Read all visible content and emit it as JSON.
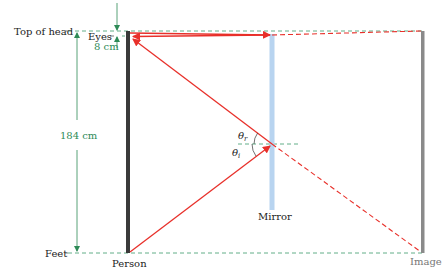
{
  "diagram": {
    "labels": {
      "top_of_head": "Top of head",
      "eyes": "Eyes",
      "eye_offset": "8 cm",
      "height": "184 cm",
      "feet": "Feet",
      "person": "Person",
      "mirror": "Mirror",
      "image": "Image",
      "theta": "θ",
      "theta_r_sub": "r",
      "theta_i_sub": "i"
    },
    "colors": {
      "ray": "#e8302a",
      "dimension": "#2e8b57",
      "guide": "#3a9a6a",
      "person": "#3a3a3a",
      "image": "#8a8a8a",
      "mirror": "#b8d4f0"
    }
  }
}
